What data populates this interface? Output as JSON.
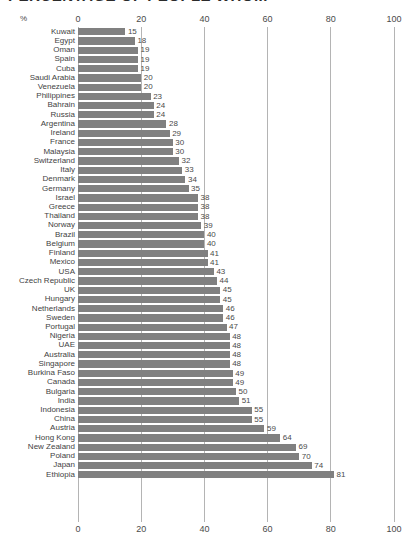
{
  "title": "PERCENTAGE OF PEOPLE WHO...",
  "axis_unit_label": "%",
  "chart_data": {
    "type": "bar",
    "orientation": "horizontal",
    "title": "PERCENTAGE OF PEOPLE WHO...",
    "xlabel": "%",
    "ylabel": "",
    "xlim": [
      0,
      100
    ],
    "xticks": [
      0,
      20,
      40,
      60,
      80,
      100
    ],
    "xtick_labels": [
      "0",
      "20",
      "40",
      "60",
      "80",
      "100"
    ],
    "grid": true,
    "grid_axis": "x",
    "legend": false,
    "bar_color": "#808080",
    "axis_top": true,
    "axis_bottom": true,
    "categories": [
      "Kuwait",
      "Egypt",
      "Oman",
      "Spain",
      "Cuba",
      "Saudi Arabia",
      "Venezuela",
      "Philippines",
      "Bahrain",
      "Russia",
      "Argentina",
      "Ireland",
      "France",
      "Malaysia",
      "Switzerland",
      "Italy",
      "Denmark",
      "Germany",
      "Israel",
      "Greece",
      "Thailand",
      "Norway",
      "Brazil",
      "Belgium",
      "Finland",
      "Mexico",
      "USA",
      "Czech Republic",
      "UK",
      "Hungary",
      "Netherlands",
      "Sweden",
      "Portugal",
      "Nigeria",
      "UAE",
      "Australia",
      "Singapore",
      "Burkina Faso",
      "Canada",
      "Bulgaria",
      "India",
      "Indonesia",
      "China",
      "Austria",
      "Hong Kong",
      "New Zealand",
      "Poland",
      "Japan",
      "Ethiopia"
    ],
    "values": [
      15,
      18,
      19,
      19,
      19,
      20,
      20,
      23,
      24,
      24,
      28,
      29,
      30,
      30,
      32,
      33,
      34,
      35,
      38,
      38,
      38,
      39,
      40,
      40,
      41,
      41,
      43,
      44,
      45,
      45,
      46,
      46,
      47,
      48,
      48,
      48,
      48,
      49,
      49,
      50,
      51,
      55,
      55,
      59,
      64,
      69,
      70,
      74,
      81
    ]
  }
}
